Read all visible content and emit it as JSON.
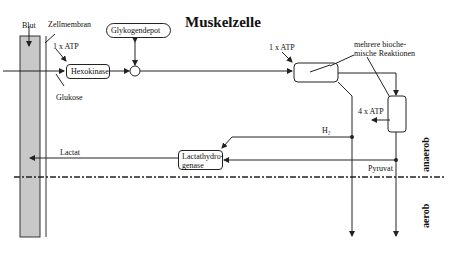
{
  "title": "Muskelzelle",
  "labels": {
    "blut": "Blut",
    "zellmembran": "Zellmembran",
    "atp1_left": "1 x ATP",
    "glukose": "Glukose",
    "glykogendepot": "Glykogendepot",
    "atp1_right": "1 x ATP",
    "reaktionen": "mehrere bioche-\nmische Reaktionen",
    "reaktionen_l1": "mehrere bioche-",
    "reaktionen_l2": "mische Reaktionen",
    "atp4": "4 x ATP",
    "h2": "H₂",
    "pyruvat": "Pyruvat",
    "lactat": "Lactat",
    "anaerob": "anaerob",
    "aerob": "aerob"
  },
  "boxes": {
    "hexokinase": "Hexokinase",
    "lactathydrogenase_l1": "Lactathydro-",
    "lactathydrogenase_l2": "genase"
  },
  "colors": {
    "blood": "#c8c8c8",
    "line": "#222222"
  }
}
